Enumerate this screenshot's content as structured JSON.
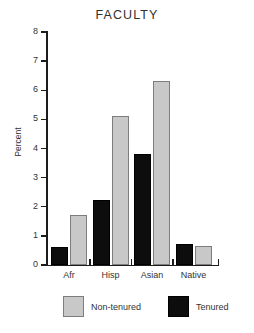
{
  "chart_data": {
    "type": "bar",
    "title": "FACULTY",
    "xlabel": "",
    "ylabel": "Percent",
    "categories": [
      "Afr",
      "Hisp",
      "Asian",
      "Native"
    ],
    "series": [
      {
        "name": "Non-tenured",
        "color": "#c8c8c8",
        "values": [
          1.72,
          5.12,
          6.32,
          0.64
        ]
      },
      {
        "name": "Tenured",
        "color": "#0d0d0d",
        "values": [
          0.62,
          2.23,
          3.81,
          0.73
        ]
      }
    ],
    "ylim": [
      0,
      8
    ],
    "yticks": [
      0,
      1,
      2,
      3,
      4,
      5,
      6,
      7,
      8
    ],
    "ytick_labels": [
      "0",
      "1",
      "2",
      "3",
      "4",
      "5",
      "6",
      "7",
      "8"
    ],
    "grid": false,
    "legend_position": "bottom"
  },
  "axis": {
    "y_labels": [
      "8",
      "7",
      "6",
      "5",
      "4",
      "3",
      "2",
      "1",
      "0"
    ],
    "y_title": "Percent",
    "x_labels": [
      "Afr",
      "Hisp",
      "Asian",
      "Native"
    ]
  },
  "legend": {
    "entries": [
      {
        "label": "Non-tenured"
      },
      {
        "label": "Tenured"
      }
    ]
  }
}
